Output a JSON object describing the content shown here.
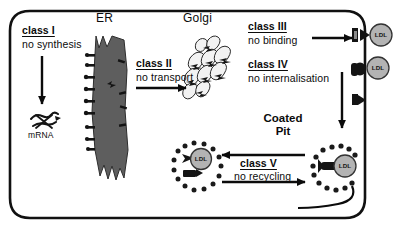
{
  "figure": {
    "kind": "cell-biology-pathway-diagram",
    "topic": "LDL receptor mutation classes",
    "cell_outline_color": "#111111",
    "organelle_fill": "#5e5e5e",
    "ldl_fill": "#b3b3b3",
    "coat_color": "#1a1a1a"
  },
  "organelles": [
    {
      "name": "er-label",
      "label": "ER"
    },
    {
      "name": "golgi-label",
      "label": "Golgi"
    },
    {
      "name": "mrna-label",
      "label": "mRNA"
    }
  ],
  "coated_pit": {
    "line1": "Coated",
    "line2": "Pit"
  },
  "classes": [
    {
      "id": "class-i",
      "title": "class I",
      "desc": "no synthesis"
    },
    {
      "id": "class-ii",
      "title": "class II",
      "desc": "no transport"
    },
    {
      "id": "class-iii",
      "title": "class III",
      "desc": "no binding"
    },
    {
      "id": "class-iv",
      "title": "class IV",
      "desc": "no internalisation"
    },
    {
      "id": "class-v",
      "title": "class V",
      "desc": "no recycling"
    }
  ],
  "particles": [
    {
      "name": "ldl-particle-top",
      "label": "LDL"
    },
    {
      "name": "ldl-particle-middle",
      "label": "LDL"
    },
    {
      "name": "ldl-particle-pit",
      "label": "LDL"
    },
    {
      "name": "ldl-particle-endosome",
      "label": "LDL"
    }
  ]
}
